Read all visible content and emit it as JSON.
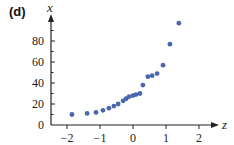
{
  "panel_label": "(d)",
  "chart_data": {
    "type": "scatter",
    "title": "",
    "xlabel": "z",
    "ylabel": "x",
    "xlim": [
      -2.2,
      2.5
    ],
    "ylim": [
      0,
      105
    ],
    "x_ticks": [
      -2,
      -1,
      0,
      1,
      2
    ],
    "x_tick_labels": [
      "−2",
      "−1",
      "0",
      "1",
      "2"
    ],
    "y_ticks": [
      0,
      20,
      40,
      60,
      80
    ],
    "y_tick_labels": [
      "0",
      "20",
      "40",
      "60",
      "80"
    ],
    "grid": false,
    "legend": null,
    "marker_color": "#4a66ad",
    "series": [
      {
        "name": "data",
        "points": [
          [
            -1.85,
            10
          ],
          [
            -1.39,
            11
          ],
          [
            -1.12,
            12
          ],
          [
            -0.91,
            14
          ],
          [
            -0.73,
            16
          ],
          [
            -0.58,
            18
          ],
          [
            -0.45,
            20
          ],
          [
            -0.3,
            23
          ],
          [
            -0.21,
            25
          ],
          [
            -0.12,
            27
          ],
          [
            0.0,
            28
          ],
          [
            0.09,
            29
          ],
          [
            0.21,
            30
          ],
          [
            0.3,
            38
          ],
          [
            0.45,
            46
          ],
          [
            0.58,
            47
          ],
          [
            0.73,
            49
          ],
          [
            0.91,
            57
          ],
          [
            1.12,
            77
          ],
          [
            1.39,
            97
          ]
        ]
      }
    ]
  }
}
